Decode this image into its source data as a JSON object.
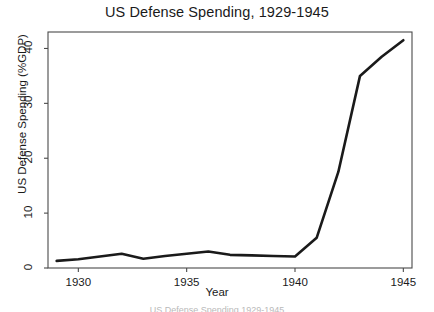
{
  "chart_data": {
    "type": "line",
    "title": "US Defense Spending, 1929-1945",
    "xlabel": "Year",
    "ylabel": "US Defense Spending (%GDP)",
    "xlim": [
      1928.6,
      1945.4
    ],
    "ylim": [
      0,
      43
    ],
    "grid": false,
    "legend": null,
    "x": [
      1929,
      1930,
      1931,
      1932,
      1933,
      1934,
      1935,
      1936,
      1937,
      1938,
      1939,
      1940,
      1941,
      1942,
      1943,
      1944,
      1945
    ],
    "values": [
      1.3,
      1.6,
      2.1,
      2.6,
      1.7,
      2.2,
      2.6,
      3.0,
      2.4,
      2.3,
      2.2,
      2.1,
      5.5,
      17.5,
      35.0,
      38.5,
      41.5
    ],
    "series": [
      {
        "name": "US Defense Spending (%GDP)",
        "color": "#1a1a1a",
        "values": [
          1.3,
          1.6,
          2.1,
          2.6,
          1.7,
          2.2,
          2.6,
          3.0,
          2.4,
          2.3,
          2.2,
          2.1,
          5.5,
          17.5,
          35.0,
          38.5,
          41.5
        ]
      }
    ],
    "xticks": [
      1930,
      1935,
      1940,
      1945
    ],
    "xtick_labels": [
      "1930",
      "1935",
      "1940",
      "1945"
    ],
    "yticks": [
      0,
      10,
      20,
      30,
      40
    ],
    "ytick_labels": [
      "0",
      "10",
      "20",
      "30",
      "40"
    ]
  },
  "figure": {
    "background_color": "#ffffff",
    "line_color": "#1a1a1a",
    "axis_color": "#4a4a4a"
  },
  "caption": {
    "clipped_text": "US Defense Spending 1929-1945"
  }
}
